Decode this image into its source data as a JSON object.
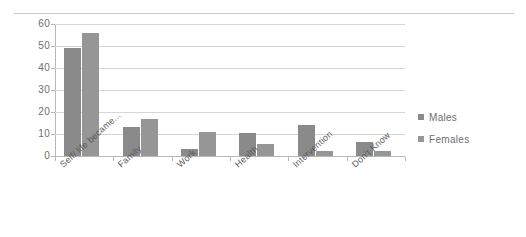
{
  "chart_data": {
    "type": "bar",
    "title": "",
    "subtitle": "",
    "xlabel": "",
    "ylabel": "",
    "categories": [
      "Self/ life became...",
      "Family",
      "Work",
      "Health",
      "Intervention",
      "Don't Know"
    ],
    "series": [
      {
        "name": "Males",
        "color": "#8a8a8a",
        "values": [
          49,
          13,
          3,
          10.5,
          14,
          6.5
        ]
      },
      {
        "name": "Females",
        "color": "#969696",
        "values": [
          56,
          17,
          11,
          5.5,
          2.5,
          2.5
        ]
      }
    ],
    "ylim": [
      0,
      60
    ],
    "yticks": [
      0,
      10,
      20,
      30,
      40,
      50,
      60
    ],
    "ytick_labels": [
      "0",
      "10",
      "20",
      "30",
      "40",
      "50",
      "60"
    ],
    "grid": true,
    "grid_axis": "y",
    "legend_position": "right",
    "legend_entries": [
      "Males",
      "Females"
    ]
  },
  "colors": {
    "males": "#8a8a8a",
    "females": "#969696",
    "gridline": "#d6d6d6",
    "axis": "#b8b8b8",
    "text": "#6e6e6e",
    "background": "#ffffff"
  }
}
